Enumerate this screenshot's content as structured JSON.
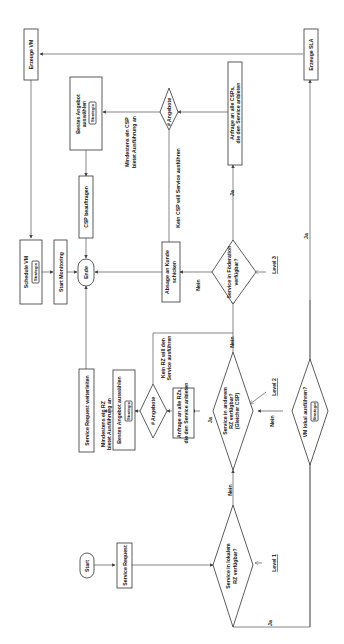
{
  "diagram": {
    "orientation": "rotated-90-ccw",
    "nodes": {
      "start": "Start",
      "service_request": "Service Request",
      "local_rz_q": [
        "Service in lokalem",
        "RZ verfügbar?"
      ],
      "other_rz_q": [
        "Service in anderem",
        "RZ verfügbar?",
        "(Gleicher CSP)"
      ],
      "vm_q": "VM lokal ausführen?",
      "vm_q_tag": "Strategie",
      "federation_q": [
        "Service in Föderation",
        "verfügbar?"
      ],
      "ask_rzs": [
        "Anfrage an alle RZs,",
        "die den Service anbieten"
      ],
      "offers_rz": "# Angebote",
      "best_offer_rz": "Bestes Angebot auswählen",
      "best_offer_rz_tag": "Strategie",
      "forward_request": "Service Request weiterleiten",
      "ask_csps": [
        "Anfrage an alle CSPs,",
        "die den Service anbieten"
      ],
      "offers_csp": "# Angebote",
      "best_offer_csp": [
        "Bestes Angebot",
        "auswählen"
      ],
      "best_offer_csp_tag": "Strategie",
      "assign_csp": "CSP beauftragen",
      "reject": [
        "Absage an Kunde",
        "schicken"
      ],
      "end": "Ende",
      "create_sla": "Erzeuge SLA",
      "create_vm": "Erzeuge VM",
      "schedule_vm": "Schedule VM",
      "schedule_vm_tag": "Strategie",
      "start_monitoring": "Start Monitoring"
    },
    "edge_labels": {
      "ja_local": "Ja",
      "nein_local": "Nein",
      "ja_other": "Ja",
      "nein_other": "Nein",
      "nein_vm": "Nein",
      "ja_vm": "Ja",
      "ja_fed": "Ja",
      "nein_fed": "Nein",
      "min_one_rz": [
        "Mindestens ein RZ",
        "bietet Ausführung an"
      ],
      "no_rz": [
        "Kein RZ will den",
        "Service ausführen"
      ],
      "min_one_csp": [
        "Mindestens ein CSP",
        "bietet Ausführung an"
      ],
      "no_csp": "Kein CSP will Service ausführen"
    },
    "levels": {
      "level1": "Level 1",
      "level2": "Level 2",
      "level3": "Level 3"
    }
  }
}
